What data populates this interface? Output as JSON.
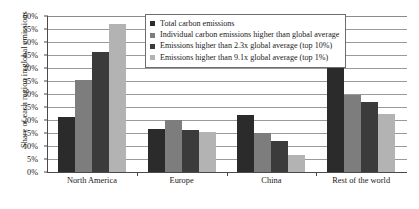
{
  "chart_data": {
    "type": "bar",
    "title": "",
    "xlabel": "",
    "ylabel": "Share of each region in global emissions",
    "ylim": [
      0,
      60
    ],
    "y_tick_labels": [
      "0%",
      "5%",
      "10%",
      "15%",
      "20%",
      "25%",
      "30%",
      "35%",
      "40%",
      "45%",
      "50%",
      "55%",
      "60%"
    ],
    "y_tick_values": [
      0,
      5,
      10,
      15,
      20,
      25,
      30,
      35,
      40,
      45,
      50,
      55,
      60
    ],
    "grid": true,
    "legend_position": "top-center",
    "categories": [
      "North America",
      "Europe",
      "China",
      "Rest of the world"
    ],
    "series": [
      {
        "name": "Total carbon emissions",
        "color": "#2b2b2b",
        "values": [
          21,
          16.5,
          22,
          41
        ]
      },
      {
        "name": "Individual carbon emissions higher than global average",
        "color": "#7d7d7d",
        "values": [
          35.5,
          20,
          15,
          29.5
        ]
      },
      {
        "name": "Emissions higher than 2.3x global average (top 10%)",
        "color": "#3b3b3b",
        "values": [
          46,
          16,
          12,
          27
        ]
      },
      {
        "name": "Emissions higher than 9.1x global average (top 1%)",
        "color": "#b3b3b3",
        "values": [
          57,
          15.5,
          6.5,
          22.5
        ]
      }
    ]
  }
}
